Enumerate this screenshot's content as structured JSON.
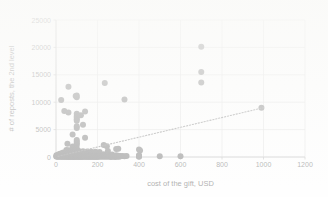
{
  "chart_data": {
    "type": "scatter",
    "title": "",
    "xlabel": "cost of the gift, USD",
    "ylabel": "# of reposts, the 2nd level",
    "xlim": [
      0,
      1200
    ],
    "ylim": [
      0,
      25000
    ],
    "xticks": [
      0,
      200,
      400,
      600,
      800,
      1000,
      1200
    ],
    "yticks": [
      0,
      5000,
      10000,
      15000,
      20000,
      25000
    ],
    "xtick_labels": [
      "0",
      "200",
      "400",
      "600",
      "800",
      "1000",
      "1200"
    ],
    "ytick_labels": [
      "0",
      "5000",
      "10000",
      "15000",
      "20000",
      "25000"
    ],
    "grid": true,
    "grid_axis": "both",
    "legend": false,
    "legend_position": "none",
    "marker_color": "#434343",
    "marker_shape": "circle",
    "marker_size": 3.0,
    "trendline": {
      "present": true,
      "style": "dotted",
      "color": "#5a5a5a",
      "x": [
        10,
        1000
      ],
      "y": [
        120,
        9000
      ]
    },
    "points": [
      [
        700,
        20100
      ],
      [
        700,
        15500
      ],
      [
        700,
        13600
      ],
      [
        990,
        9000
      ],
      [
        235,
        13500
      ],
      [
        60,
        12800
      ],
      [
        330,
        10500
      ],
      [
        25,
        10400
      ],
      [
        100,
        11200
      ],
      [
        100,
        10900
      ],
      [
        95,
        11150
      ],
      [
        40,
        8400
      ],
      [
        60,
        8100
      ],
      [
        140,
        8300
      ],
      [
        100,
        7900
      ],
      [
        100,
        7500
      ],
      [
        100,
        7200
      ],
      [
        100,
        6900
      ],
      [
        100,
        6600
      ],
      [
        120,
        7600
      ],
      [
        130,
        5900
      ],
      [
        100,
        5600
      ],
      [
        100,
        5300
      ],
      [
        80,
        4100
      ],
      [
        140,
        3500
      ],
      [
        100,
        3100
      ],
      [
        100,
        2800
      ],
      [
        100,
        2500
      ],
      [
        55,
        2400
      ],
      [
        100,
        2200
      ],
      [
        80,
        1900
      ],
      [
        100,
        1600
      ],
      [
        230,
        2200
      ],
      [
        245,
        1950
      ],
      [
        50,
        1300
      ],
      [
        60,
        1250
      ],
      [
        70,
        1200
      ],
      [
        90,
        1150
      ],
      [
        110,
        1100
      ],
      [
        130,
        1050
      ],
      [
        150,
        1000
      ],
      [
        170,
        980
      ],
      [
        190,
        950
      ],
      [
        210,
        900
      ],
      [
        250,
        1100
      ],
      [
        290,
        1450
      ],
      [
        300,
        1500
      ],
      [
        400,
        1350
      ],
      [
        405,
        1200
      ],
      [
        2,
        300
      ],
      [
        5,
        250
      ],
      [
        8,
        220
      ],
      [
        10,
        400
      ],
      [
        12,
        180
      ],
      [
        15,
        500
      ],
      [
        18,
        230
      ],
      [
        20,
        600
      ],
      [
        22,
        160
      ],
      [
        25,
        350
      ],
      [
        28,
        700
      ],
      [
        30,
        450
      ],
      [
        32,
        190
      ],
      [
        35,
        800
      ],
      [
        38,
        260
      ],
      [
        40,
        520
      ],
      [
        42,
        310
      ],
      [
        45,
        640
      ],
      [
        48,
        170
      ],
      [
        50,
        900
      ],
      [
        52,
        380
      ],
      [
        55,
        210
      ],
      [
        58,
        560
      ],
      [
        60,
        730
      ],
      [
        62,
        140
      ],
      [
        65,
        420
      ],
      [
        68,
        290
      ],
      [
        70,
        850
      ],
      [
        72,
        200
      ],
      [
        75,
        610
      ],
      [
        78,
        330
      ],
      [
        80,
        470
      ],
      [
        82,
        150
      ],
      [
        85,
        720
      ],
      [
        88,
        240
      ],
      [
        90,
        540
      ],
      [
        92,
        360
      ],
      [
        95,
        180
      ],
      [
        98,
        660
      ],
      [
        100,
        430
      ],
      [
        103,
        270
      ],
      [
        105,
        780
      ],
      [
        108,
        200
      ],
      [
        110,
        590
      ],
      [
        113,
        340
      ],
      [
        115,
        160
      ],
      [
        118,
        500
      ],
      [
        120,
        250
      ],
      [
        125,
        680
      ],
      [
        130,
        390
      ],
      [
        135,
        210
      ],
      [
        140,
        560
      ],
      [
        145,
        300
      ],
      [
        150,
        440
      ],
      [
        155,
        180
      ],
      [
        160,
        620
      ],
      [
        165,
        260
      ],
      [
        170,
        350
      ],
      [
        175,
        200
      ],
      [
        180,
        480
      ],
      [
        185,
        290
      ],
      [
        190,
        700
      ],
      [
        195,
        230
      ],
      [
        200,
        410
      ],
      [
        210,
        310
      ],
      [
        220,
        190
      ],
      [
        230,
        520
      ],
      [
        240,
        260
      ],
      [
        250,
        380
      ],
      [
        260,
        210
      ],
      [
        270,
        460
      ],
      [
        280,
        170
      ],
      [
        290,
        330
      ],
      [
        300,
        250
      ],
      [
        300,
        120
      ],
      [
        310,
        200
      ],
      [
        320,
        160
      ],
      [
        330,
        140
      ],
      [
        340,
        180
      ],
      [
        400,
        300
      ],
      [
        400,
        180
      ],
      [
        400,
        120
      ],
      [
        400,
        60
      ],
      [
        500,
        150
      ],
      [
        600,
        140
      ],
      [
        1,
        80
      ],
      [
        3,
        120
      ],
      [
        6,
        90
      ],
      [
        9,
        60
      ],
      [
        13,
        110
      ],
      [
        16,
        70
      ],
      [
        19,
        130
      ],
      [
        23,
        50
      ],
      [
        26,
        100
      ],
      [
        29,
        85
      ],
      [
        33,
        65
      ],
      [
        36,
        115
      ],
      [
        39,
        45
      ],
      [
        43,
        95
      ],
      [
        46,
        75
      ],
      [
        49,
        55
      ],
      [
        53,
        105
      ],
      [
        56,
        40
      ],
      [
        59,
        88
      ],
      [
        63,
        68
      ],
      [
        66,
        48
      ],
      [
        69,
        98
      ],
      [
        73,
        58
      ],
      [
        76,
        78
      ],
      [
        79,
        38
      ],
      [
        83,
        92
      ],
      [
        86,
        62
      ],
      [
        89,
        42
      ],
      [
        93,
        82
      ],
      [
        96,
        52
      ],
      [
        99,
        72
      ],
      [
        102,
        35
      ],
      [
        106,
        86
      ],
      [
        109,
        56
      ],
      [
        112,
        46
      ],
      [
        116,
        76
      ],
      [
        119,
        36
      ],
      [
        123,
        66
      ],
      [
        127,
        50
      ],
      [
        131,
        30
      ],
      [
        136,
        70
      ],
      [
        141,
        40
      ],
      [
        146,
        60
      ],
      [
        151,
        32
      ],
      [
        156,
        54
      ],
      [
        161,
        38
      ],
      [
        166,
        64
      ],
      [
        171,
        28
      ],
      [
        176,
        48
      ],
      [
        181,
        34
      ],
      [
        186,
        58
      ],
      [
        191,
        26
      ],
      [
        196,
        44
      ],
      [
        201,
        30
      ],
      [
        206,
        50
      ],
      [
        215,
        35
      ],
      [
        225,
        25
      ],
      [
        235,
        42
      ],
      [
        245,
        28
      ],
      [
        255,
        36
      ],
      [
        265,
        22
      ],
      [
        275,
        40
      ],
      [
        285,
        20
      ],
      [
        295,
        32
      ],
      [
        305,
        24
      ]
    ]
  }
}
